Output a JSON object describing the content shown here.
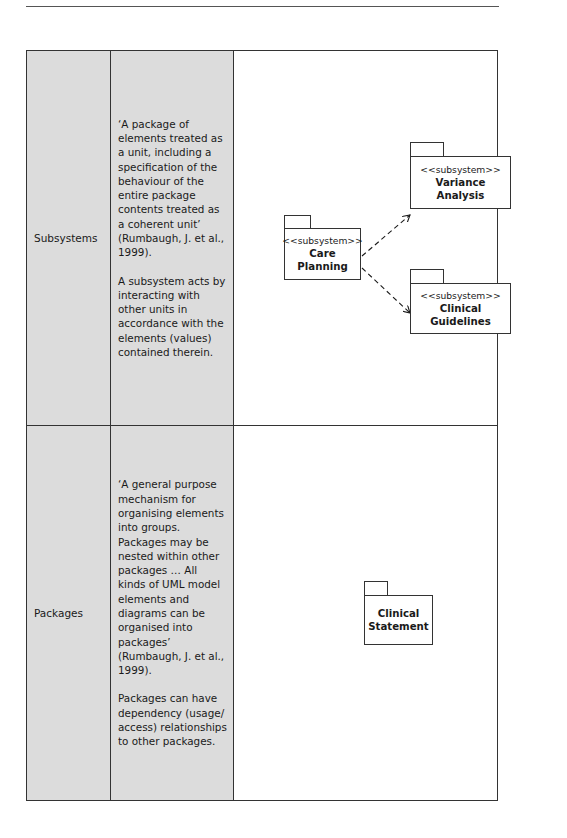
{
  "table": {
    "rows": [
      {
        "term": "Subsystems",
        "description": [
          "‘A package of elements treated as a unit, including a specification of the behaviour of the entire package contents treated as a coherent unit’ (Rumbaugh, J. et al., 1999).",
          "A subsystem acts by interacting with other units in accordance with the elements (values) contained therein."
        ],
        "diagram": {
          "packages": [
            {
              "stereotype": "<<subsystem>>",
              "name": "Care Planning"
            },
            {
              "stereotype": "<<subsystem>>",
              "name": "Variance Analysis"
            },
            {
              "stereotype": "<<subsystem>>",
              "name": "Clinical Guidelines"
            }
          ],
          "dependencies": [
            {
              "from": "Care Planning",
              "to": "Variance Analysis",
              "style": "dashed-arrow"
            },
            {
              "from": "Care Planning",
              "to": "Clinical Guidelines",
              "style": "dashed-arrow"
            }
          ]
        }
      },
      {
        "term": "Packages",
        "description": [
          "‘A general purpose mechanism for organising elements into groups. Packages may be nested within other packages … All kinds of UML model elements and diagrams can be organised into packages’ (Rumbaugh, J. et al., 1999).",
          "Packages can have dependency (usage/ access) relationships to other packages."
        ],
        "diagram": {
          "packages": [
            {
              "name_line1": "Clinical",
              "name_line2": "Statement"
            }
          ]
        }
      }
    ]
  },
  "colors": {
    "shaded_cell": "#dcdcdc",
    "border": "#333333",
    "text": "#1a1a1a"
  }
}
